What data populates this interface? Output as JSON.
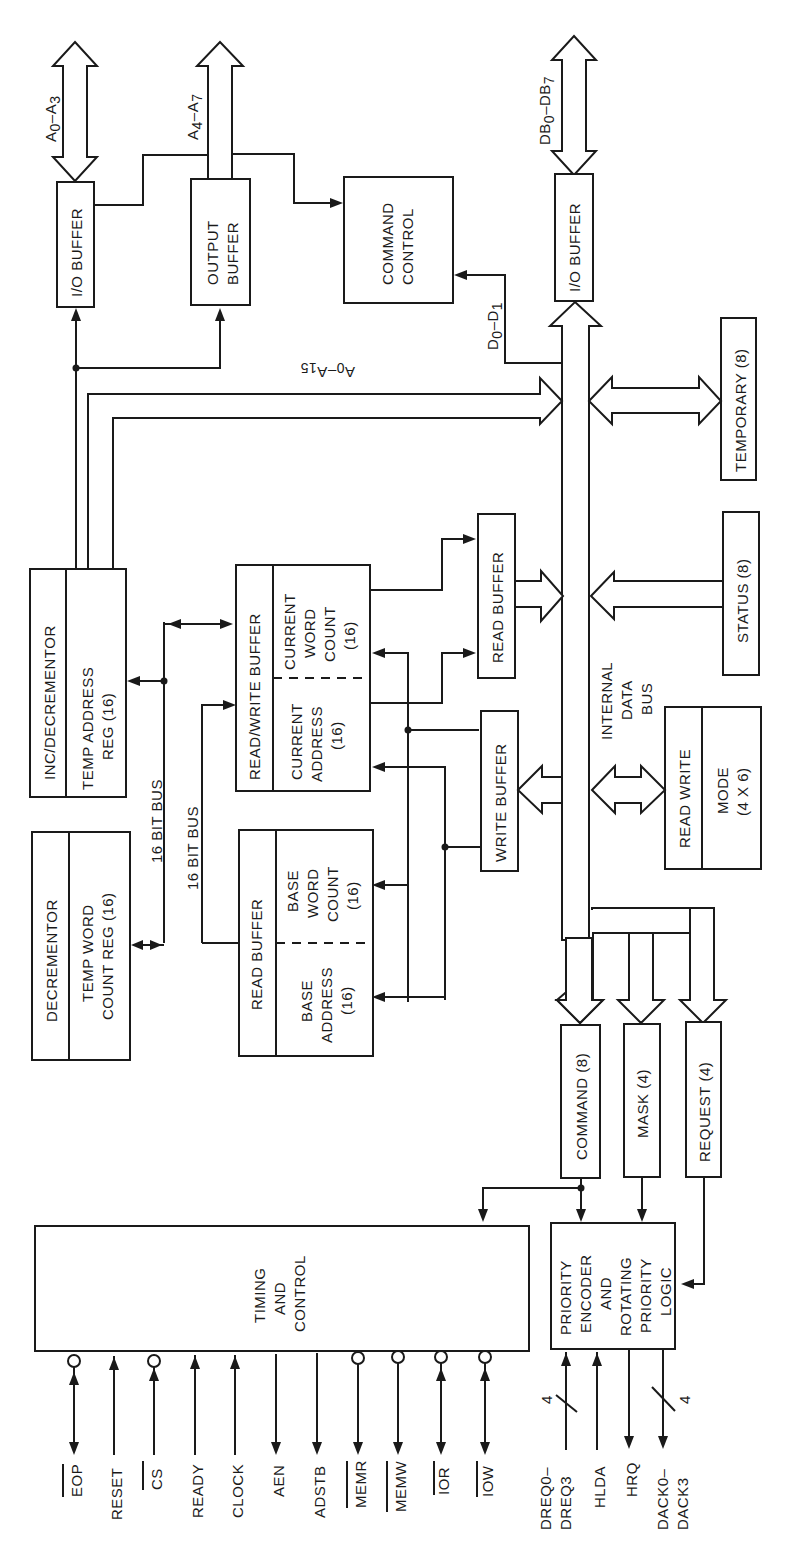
{
  "diagram": {
    "blocks": {
      "io_buffer_addr": "I/O BUFFER",
      "output_buffer": [
        "OUTPUT",
        "BUFFER"
      ],
      "command_control": [
        "COMMAND",
        "CONTROL"
      ],
      "io_buffer_data": "I/O BUFFER",
      "inc_decrementor": "INC/DECREMENTOR",
      "temp_address_reg": [
        "TEMP ADDRESS",
        "REG (16)"
      ],
      "decrementor": "DECREMENTOR",
      "temp_word_count_reg": [
        "TEMP WORD",
        "COUNT REG (16)"
      ],
      "read_write_buffer": "READ/WRITE BUFFER",
      "current_word_count": [
        "CURRENT",
        "WORD",
        "COUNT",
        "(16)"
      ],
      "current_address": [
        "CURRENT",
        "ADDRESS",
        "(16)"
      ],
      "read_buffer_base": "READ BUFFER",
      "base_word_count": [
        "BASE",
        "WORD",
        "COUNT",
        "(16)"
      ],
      "base_address": [
        "BASE",
        "ADDRESS",
        "(16)"
      ],
      "read_buffer": "READ BUFFER",
      "write_buffer": "WRITE BUFFER",
      "temporary": "TEMPORARY (8)",
      "status": "STATUS (8)",
      "mode_read_write": "READ WRITE",
      "mode": [
        "MODE",
        "(4 X 6)"
      ],
      "command_reg": "COMMAND (8)",
      "mask_reg": "MASK (4)",
      "request_reg": "REQUEST (4)",
      "timing_control": [
        "TIMING",
        "AND",
        "CONTROL"
      ],
      "priority_logic": [
        "PRIORITY",
        "ENCODER",
        "AND",
        "ROTATING",
        "PRIORITY",
        "LOGIC"
      ]
    },
    "bus_labels": {
      "a0_a3": {
        "main": "A",
        "sub1": "0",
        "dash": "–A",
        "sub2": "3"
      },
      "a4_a7": {
        "main": "A",
        "sub1": "4",
        "dash": "–A",
        "sub2": "7"
      },
      "db0_db7": {
        "main": "DB",
        "sub1": "0",
        "dash": "–DB",
        "sub2": "7"
      },
      "d0_d1": {
        "main": "D",
        "sub1": "0",
        "dash": "–D",
        "sub2": "1"
      },
      "a0_a15": {
        "main": "A",
        "sub1": "0",
        "dash": "–A",
        "sub2": "15"
      },
      "bus16_a": "16 BIT BUS",
      "bus16_b": "16 BIT BUS",
      "internal_data_bus": [
        "INTERNAL",
        "DATA",
        "BUS"
      ]
    },
    "pins": {
      "timing": [
        {
          "name": "EOP",
          "overbar": true,
          "bubble": true,
          "dir": "bidirectional"
        },
        {
          "name": "RESET",
          "overbar": false,
          "bubble": false,
          "dir": "in"
        },
        {
          "name": "CS",
          "overbar": true,
          "bubble": true,
          "dir": "in"
        },
        {
          "name": "READY",
          "overbar": false,
          "bubble": false,
          "dir": "in"
        },
        {
          "name": "CLOCK",
          "overbar": false,
          "bubble": false,
          "dir": "in"
        },
        {
          "name": "AEN",
          "overbar": false,
          "bubble": false,
          "dir": "out"
        },
        {
          "name": "ADSTB",
          "overbar": false,
          "bubble": false,
          "dir": "out"
        },
        {
          "name": "MEMR",
          "overbar": true,
          "bubble": true,
          "dir": "out"
        },
        {
          "name": "MEMW",
          "overbar": true,
          "bubble": true,
          "dir": "out"
        },
        {
          "name": "IOR",
          "overbar": true,
          "bubble": true,
          "dir": "bidirectional"
        },
        {
          "name": "IOW",
          "overbar": true,
          "bubble": true,
          "dir": "bidirectional"
        }
      ],
      "priority": [
        {
          "name": [
            "DREQ0–",
            "DREQ3"
          ],
          "dir": "in",
          "width": "4"
        },
        {
          "name": [
            "HLDA"
          ],
          "dir": "in"
        },
        {
          "name": [
            "HRQ"
          ],
          "dir": "out"
        },
        {
          "name": [
            "DACK0–",
            "DACK3"
          ],
          "dir": "out",
          "width": "4"
        }
      ]
    }
  }
}
